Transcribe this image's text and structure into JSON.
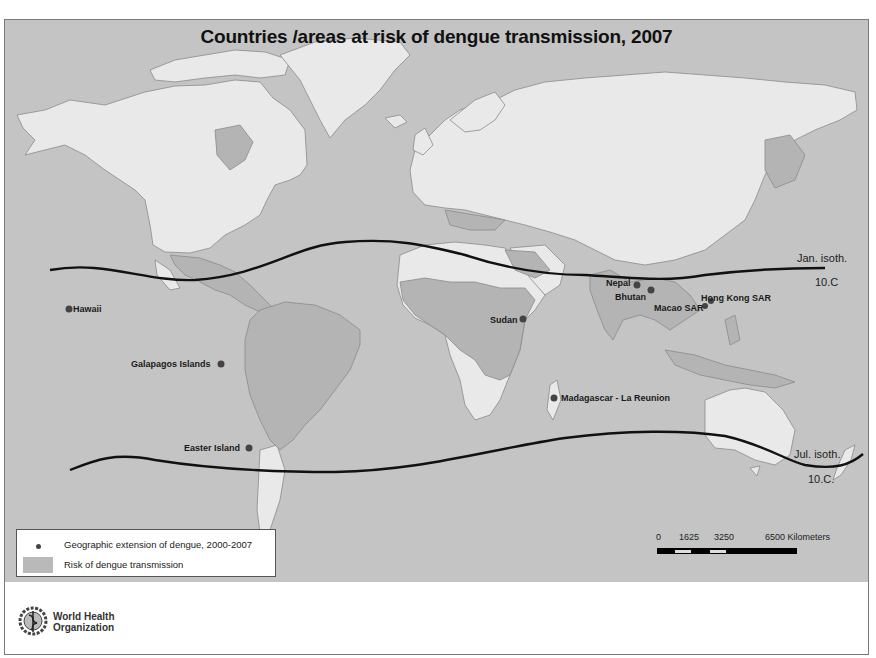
{
  "title": "Countries /areas at risk of dengue transmission, 2007",
  "colors": {
    "ocean": "#c4c4c4",
    "land_no_risk": "#e9e9e9",
    "land_risk": "#b4b4b4",
    "borders": "#8a8a8a",
    "isotherm": "#111111",
    "point": "#444444"
  },
  "isotherms": [
    {
      "name": "january",
      "label": "Jan. isoth.",
      "value_label": "10.C"
    },
    {
      "name": "july",
      "label": "Jul. isoth.",
      "value_label": "10.C."
    }
  ],
  "points": [
    {
      "label": "Hawaii"
    },
    {
      "label": "Galapagos Islands"
    },
    {
      "label": "Easter Island"
    },
    {
      "label": "Sudan"
    },
    {
      "label": "Madagascar - La Reunion"
    },
    {
      "label": "Nepal"
    },
    {
      "label": "Bhutan"
    },
    {
      "label": "Macao SAR"
    },
    {
      "label": "Hong Kong SAR"
    }
  ],
  "legend": {
    "items": [
      {
        "symbol": "dot",
        "label": "Geographic extension of dengue, 2000-2007"
      },
      {
        "symbol": "swatch",
        "label": "Risk of dengue transmission"
      }
    ]
  },
  "scale_bar": {
    "ticks": [
      "0",
      "1625",
      "3250",
      "6500 Kilometers"
    ]
  },
  "organization": {
    "line1": "World Health",
    "line2": "Organization"
  }
}
